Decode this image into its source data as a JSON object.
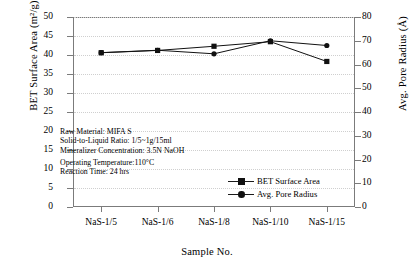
{
  "chart_data": {
    "type": "line",
    "title": "",
    "xlabel": "Sample No.",
    "categories": [
      "NaS-1/5",
      "NaS-1/6",
      "NaS-1/8",
      "NaS-1/10",
      "NaS-1/15"
    ],
    "grid": true,
    "legend_position": "inside-bottom-right",
    "axes": {
      "left": {
        "label": "BET Surface Area (m²/g)",
        "ylim": [
          0,
          50
        ],
        "tick_step": 5,
        "ticks": [
          50,
          45,
          40,
          35,
          30,
          25,
          20,
          15,
          10,
          5,
          0
        ]
      },
      "right": {
        "label": "Avg. Pore Radius (Å)",
        "ylim": [
          0,
          80
        ],
        "tick_step": 10,
        "ticks": [
          80,
          70,
          60,
          50,
          40,
          30,
          20,
          10,
          0
        ]
      }
    },
    "series": [
      {
        "name": "BET Surface Area",
        "axis": "left",
        "marker": "square",
        "color": "#111111",
        "values": [
          40.6,
          41.2,
          42.3,
          43.5,
          38.3
        ]
      },
      {
        "name": "Avg. Pore Radius",
        "axis": "right",
        "marker": "circle",
        "color": "#111111",
        "values": [
          65.0,
          66.0,
          64.5,
          70.0,
          68.0
        ]
      }
    ],
    "annotations": [
      "Raw Material: MIFA S",
      "Solid-to-Liquid Ratio: 1/5~1g/15ml",
      "Mineralizer Concentration: 3.5N NaOH",
      "Operating Temperature:110°C",
      "Reaction Time: 24 hrs"
    ]
  }
}
